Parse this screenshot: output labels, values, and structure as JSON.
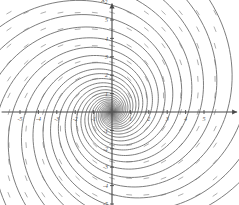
{
  "figure": {
    "kind": "phase-portrait",
    "background": "#ffffff",
    "width": 239,
    "height": 205
  },
  "chart_data": {
    "type": "scatter",
    "title": "",
    "subtitle": "",
    "xlabel": "x_1",
    "ylabel": "x_2",
    "xlabel_display": "x",
    "xlabel_sub": "1",
    "ylabel_display": "x",
    "ylabel_sub": "2",
    "xlim": [
      -6.0,
      6.8
    ],
    "ylim": [
      -5.9,
      5.9
    ],
    "grid": false,
    "legend": null,
    "legend_position": "none",
    "axis_style": {
      "color": "#4a4a4a",
      "width": 1.1,
      "arrow_x": "right",
      "arrow_y": "up",
      "tick_length": 4
    },
    "xticks": [
      -5,
      -4,
      -3,
      -2,
      -1,
      1,
      2,
      3,
      4,
      5
    ],
    "xticklabels": [
      "-5",
      "-4",
      "-3",
      "-2",
      "-1",
      "1",
      "2",
      "3",
      "4",
      "5"
    ],
    "yticks": [
      -5,
      -4,
      -3,
      -2,
      -1,
      1,
      2,
      3,
      4,
      5
    ],
    "yticklabels": [
      "-5",
      "-4",
      "-3",
      "-2",
      "-1",
      "1",
      "2",
      "3",
      "4",
      "5"
    ],
    "tick_label_color": "#555555",
    "tick_label_size": 6,
    "system": {
      "description": "stable spiral (focus) at origin, clockwise inward",
      "equilibrium": [
        0,
        0
      ],
      "equilibrium_type": "stable-spiral",
      "rotation": "clockwise",
      "spiral_decay_b": 0.3,
      "spiral_omega": 1.0
    },
    "trajectories": {
      "color": "#6e6e6e",
      "width": 0.9,
      "count": 14,
      "start_angles_deg": [
        0,
        26,
        52,
        78,
        104,
        130,
        156,
        182,
        208,
        234,
        260,
        286,
        312,
        338
      ],
      "start_radius": 8.2,
      "turns": 3.1
    },
    "direction_field": {
      "color": "#9a9a9a",
      "width": 0.8,
      "dash_length": 5.0,
      "style": "dashed-segments",
      "grid_nx": 13,
      "grid_ny": 13,
      "x_range": [
        -5.6,
        5.6
      ],
      "y_range": [
        -5.4,
        5.4
      ]
    }
  }
}
